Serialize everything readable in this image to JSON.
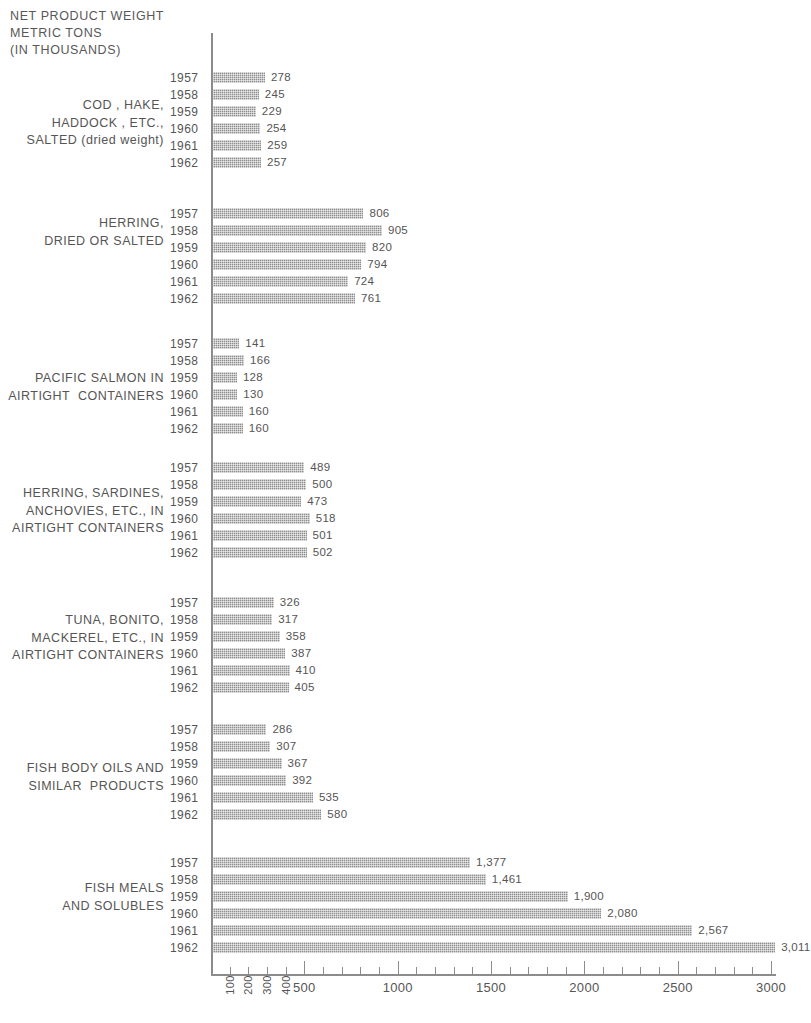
{
  "chart_data": {
    "type": "bar",
    "orientation": "horizontal",
    "title": "NET PRODUCT WEIGHT\nMETRIC TONS\n(IN THOUSANDS)",
    "xlabel": "",
    "ylabel": "",
    "xlim": [
      0,
      3000
    ],
    "grid": false,
    "legend": null,
    "categories": [
      "1957",
      "1958",
      "1959",
      "1960",
      "1961",
      "1962"
    ],
    "x_ticks_major": [
      500,
      1000,
      1500,
      2000,
      2500,
      3000
    ],
    "x_ticks_minor": [
      100,
      200,
      300,
      400,
      600,
      700,
      800,
      900,
      1100,
      1200,
      1300,
      1400,
      1600,
      1700,
      1800,
      1900,
      2100,
      2200,
      2300,
      2400,
      2600,
      2700,
      2800,
      2900
    ],
    "x_tick_labels_rotated": [
      "100",
      "200",
      "300",
      "400"
    ],
    "x_tick_labels_horizontal": [
      "500",
      "1000",
      "1500",
      "2000",
      "2500",
      "3000"
    ],
    "groups": [
      {
        "label": "COD , HAKE,\nHADDOCK , ETC.,\nSALTED (dried weight)",
        "values": [
          278,
          245,
          229,
          254,
          259,
          257
        ],
        "value_labels": [
          "278",
          "245",
          "229",
          "254",
          "259",
          "257"
        ]
      },
      {
        "label": "HERRING,\nDRIED OR SALTED",
        "values": [
          806,
          905,
          820,
          794,
          724,
          761
        ],
        "value_labels": [
          "806",
          "905",
          "820",
          "794",
          "724",
          "761"
        ]
      },
      {
        "label": "PACIFIC SALMON IN\nAIRTIGHT  CONTAINERS",
        "values": [
          141,
          166,
          128,
          130,
          160,
          160
        ],
        "value_labels": [
          "141",
          "166",
          "128",
          "130",
          "160",
          "160"
        ]
      },
      {
        "label": "HERRING, SARDINES,\nANCHOVIES, ETC., IN\nAIRTIGHT CONTAINERS",
        "values": [
          489,
          500,
          473,
          518,
          501,
          502
        ],
        "value_labels": [
          "489",
          "500",
          "473",
          "518",
          "501",
          "502"
        ]
      },
      {
        "label": "TUNA, BONITO,\nMACKEREL, ETC., IN\nAIRTIGHT CONTAINERS",
        "values": [
          326,
          317,
          358,
          387,
          410,
          405
        ],
        "value_labels": [
          "326",
          "317",
          "358",
          "387",
          "410",
          "405"
        ]
      },
      {
        "label": "FISH BODY OILS AND\nSIMILAR  PRODUCTS",
        "values": [
          286,
          307,
          367,
          392,
          535,
          580
        ],
        "value_labels": [
          "286",
          "307",
          "367",
          "392",
          "535",
          "580"
        ]
      },
      {
        "label": "FISH MEALS\nAND SOLUBLES",
        "values": [
          1377,
          1461,
          1900,
          2080,
          2567,
          3011
        ],
        "value_labels": [
          "1,377",
          "1,461",
          "1,900",
          "2,080",
          "2,567",
          "3,011"
        ]
      }
    ]
  },
  "layout": {
    "group_tops": [
      70,
      206,
      336,
      460,
      595,
      722,
      855
    ],
    "label_tops": [
      97,
      215,
      370,
      485,
      612,
      760,
      880
    ],
    "row_height": 17,
    "axis_origin_x": 213,
    "px_per_unit": 0.1867,
    "bar_height": 11
  },
  "colors": {
    "bar": "#8e8e8e",
    "text": "#555555",
    "axis": "#8c8c8c",
    "background": "#ffffff"
  }
}
